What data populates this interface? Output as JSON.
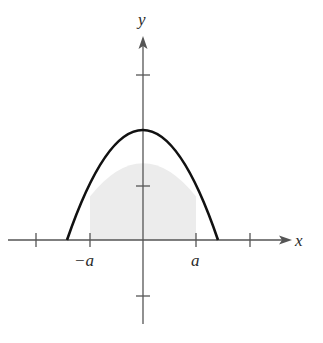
{
  "figure": {
    "type": "function-graph",
    "axes": {
      "x_label": "x",
      "y_label": "y",
      "x_tick_labels": [
        "−a",
        "a"
      ]
    },
    "curve": {
      "shape": "parabola",
      "opens": "down",
      "vertex_on_y_axis": true
    },
    "shaded_region": {
      "from": "−a",
      "to": "a",
      "fill": "#ececec"
    },
    "colors": {
      "axis": "#555555",
      "curve": "#111111",
      "shade": "#ececec",
      "label": "#2a2a2a"
    }
  }
}
